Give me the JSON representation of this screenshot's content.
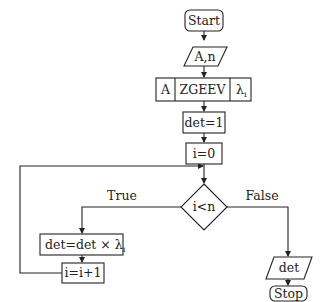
{
  "diagram": {
    "type": "flowchart",
    "nodes": {
      "start": {
        "label": "Start",
        "shape": "rounded-rect"
      },
      "input": {
        "label": "A,n",
        "shape": "parallelogram"
      },
      "zgeev": {
        "left": "A",
        "center": "ZGEEV",
        "right_base": "λ",
        "right_sub": "i",
        "shape": "subroutine"
      },
      "det_init": {
        "label": "det=1",
        "shape": "rect"
      },
      "i_init": {
        "label": "i=0",
        "shape": "rect"
      },
      "cond": {
        "label": "i<n",
        "shape": "diamond"
      },
      "det_update": {
        "label": "det=det × λ",
        "sub": "i",
        "shape": "rect"
      },
      "i_inc": {
        "label": "i=i+1",
        "shape": "rect"
      },
      "output": {
        "label": "det",
        "shape": "parallelogram"
      },
      "stop": {
        "label": "Stop",
        "shape": "rounded-rect"
      }
    },
    "edge_labels": {
      "true": "True",
      "false": "False"
    },
    "colors": {
      "stroke": "#222222",
      "background": "#ffffff"
    }
  }
}
